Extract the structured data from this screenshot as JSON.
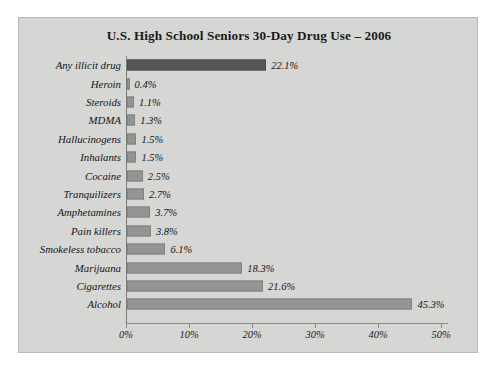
{
  "chart_data": {
    "type": "bar",
    "orientation": "horizontal",
    "title": "U.S. High School Seniors 30-Day Drug Use – 2006",
    "xlabel": "",
    "ylabel": "",
    "xlim": [
      0,
      50
    ],
    "grid": false,
    "legend": null,
    "tick_labels": [
      "0%",
      "10%",
      "20%",
      "30%",
      "40%",
      "50%"
    ],
    "tick_values": [
      0,
      10,
      20,
      30,
      40,
      50
    ],
    "categories": [
      "Any illicit drug",
      "Heroin",
      "Steroids",
      "MDMA",
      "Hallucinogens",
      "Inhalants",
      "Cocaine",
      "Tranquilizers",
      "Amphetamines",
      "Pain killers",
      "Smokeless tobacco",
      "Marijuana",
      "Cigarettes",
      "Alcohol"
    ],
    "values": [
      22.1,
      0.4,
      1.1,
      1.3,
      1.5,
      1.5,
      2.5,
      2.7,
      3.7,
      3.8,
      6.1,
      18.3,
      21.6,
      45.3
    ],
    "data_labels": [
      "22.1%",
      "0.4%",
      "1.1%",
      "1.3%",
      "1.5%",
      "1.5%",
      "2.5%",
      "2.7%",
      "3.7%",
      "3.8%",
      "6.1%",
      "18.3%",
      "21.6%",
      "45.3%"
    ],
    "highlight_index": 0,
    "colors": {
      "bar": "#949492",
      "bar_highlight": "#565654",
      "panel_background": "#d6d6d4",
      "page_background": "#ffffff",
      "text": "#141414",
      "axis": "#8a8a88"
    }
  }
}
